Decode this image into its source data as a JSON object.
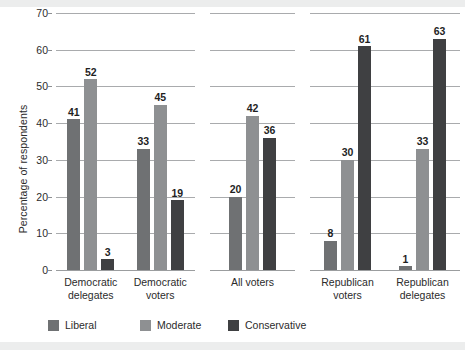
{
  "chart_data": {
    "type": "bar",
    "title": "",
    "subtitle": "",
    "xlabel": "",
    "ylabel": "Percentage of respondents",
    "ylim": [
      0,
      70
    ],
    "yticks": [
      0,
      10,
      20,
      30,
      40,
      50,
      60,
      70
    ],
    "ytick_labels": [
      "0",
      "10",
      "20",
      "30",
      "40",
      "50",
      "60",
      "70"
    ],
    "grid": "horizontal",
    "legend_position": "bottom",
    "categories": [
      "Democratic delegates",
      "Democratic voters",
      "All voters",
      "Republican voters",
      "Republican delegates"
    ],
    "series": [
      {
        "name": "Liberal",
        "color": "#6f7173",
        "values": [
          41,
          33,
          20,
          8,
          1
        ]
      },
      {
        "name": "Moderate",
        "color": "#8e9092",
        "values": [
          52,
          45,
          42,
          30,
          33
        ]
      },
      {
        "name": "Conservative",
        "color": "#3f4042",
        "values": [
          3,
          19,
          36,
          61,
          63
        ]
      }
    ],
    "panels": [
      {
        "name": "democratic",
        "groups": [
          "Democratic delegates",
          "Democratic voters"
        ]
      },
      {
        "name": "all-voters",
        "groups": [
          "All voters"
        ]
      },
      {
        "name": "republican",
        "groups": [
          "Republican voters",
          "Republican delegates"
        ]
      }
    ],
    "group_labels": [
      {
        "line1": "Democratic",
        "line2": "delegates"
      },
      {
        "line1": "Democratic",
        "line2": "voters"
      },
      {
        "line1": "All voters",
        "line2": ""
      },
      {
        "line1": "Republican",
        "line2": "voters"
      },
      {
        "line1": "Republican",
        "line2": "delegates"
      }
    ],
    "data_labels": {
      "democratic_delegates": [
        "41",
        "52",
        "3"
      ],
      "democratic_voters": [
        "33",
        "45",
        "19"
      ],
      "all_voters": [
        "20",
        "42",
        "36"
      ],
      "republican_voters": [
        "8",
        "30",
        "61"
      ],
      "republican_delegates": [
        "1",
        "33",
        "63"
      ]
    }
  },
  "legend": {
    "items": [
      {
        "label": "Liberal",
        "color": "#6f7173"
      },
      {
        "label": "Moderate",
        "color": "#8e9092"
      },
      {
        "label": "Conservative",
        "color": "#3f4042"
      }
    ]
  },
  "axis": {
    "y_title": "Percentage of respondents"
  }
}
